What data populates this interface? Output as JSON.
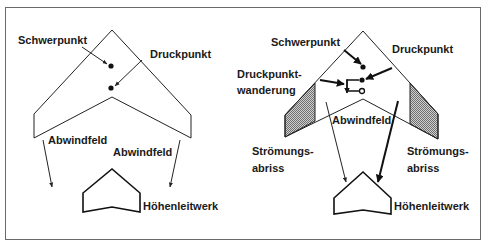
{
  "diagram": {
    "type": "flying-wing-stall-comparison",
    "left_panel": {
      "labels": {
        "center_of_gravity": "Schwerpunkt",
        "center_of_pressure": "Druckpunkt",
        "downwash_left": "Abwindfeld",
        "downwash_right": "Abwindfeld",
        "tailplane": "Höhenleitwerk"
      }
    },
    "right_panel": {
      "labels": {
        "center_of_gravity": "Schwerpunkt",
        "center_of_pressure": "Druckpunkt",
        "cp_shift_line1": "Druckpunkt-",
        "cp_shift_line2": "wanderung",
        "downwash": "Abwindfeld",
        "stall_left_line1": "Strömungs-",
        "stall_left_line2": "abriss",
        "stall_right_line1": "Strömungs-",
        "stall_right_line2": "abriss",
        "tailplane": "Höhenleitwerk"
      }
    },
    "colors": {
      "line": "#222222",
      "frame": "#555555",
      "hatch": "#9a9a9a",
      "background": "#ffffff"
    }
  }
}
